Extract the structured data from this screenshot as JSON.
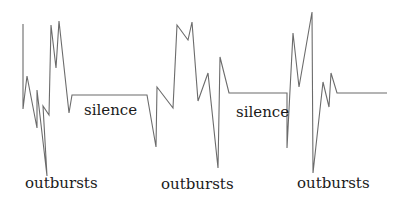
{
  "diagram": {
    "segments": [
      {
        "kind": "outburst",
        "label": "outbursts"
      },
      {
        "kind": "silence",
        "label": "silence"
      },
      {
        "kind": "outburst",
        "label": "outbursts"
      },
      {
        "kind": "silence",
        "label": "silence"
      },
      {
        "kind": "outburst",
        "label": "outbursts"
      }
    ],
    "labels": {
      "outburst_1": "outbursts",
      "silence_1": "silence",
      "outburst_2": "outbursts",
      "silence_2": "silence",
      "outburst_3": "outbursts"
    },
    "line_color": "#6b6b6b",
    "text_color": "#1a1a1a"
  }
}
